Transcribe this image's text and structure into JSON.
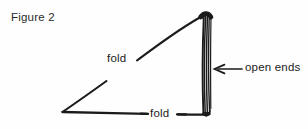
{
  "figure": {
    "caption": "Figure 2",
    "background_color": "#fefefe",
    "ink_color": "#1b1b1b"
  },
  "labels": {
    "fold_upper": "fold",
    "fold_lower": "fold",
    "open_ends": "open ends"
  },
  "annotations": {
    "arrow_icon": "arrow-left-icon",
    "arrow_points_to": "open ends"
  },
  "diagram": {
    "edges": [
      {
        "name": "hypotenuse",
        "label": "fold"
      },
      {
        "name": "bottom",
        "label": "fold"
      },
      {
        "name": "right-vertical",
        "label": "open ends"
      }
    ]
  }
}
